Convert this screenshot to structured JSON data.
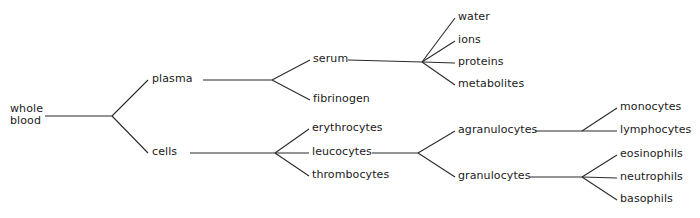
{
  "diagram": {
    "type": "tree-diagram",
    "background_color": "#ffffff",
    "line_color": "#2b2b2b",
    "text_color": "#1a1a1a",
    "nodes": [
      {
        "id": "whole-blood",
        "label": "whole\nblood",
        "x": 10,
        "y": 116,
        "anchor": "left",
        "lines": 2
      },
      {
        "id": "plasma",
        "label": "plasma",
        "x": 152,
        "y": 80,
        "anchor": "left",
        "lines": 1
      },
      {
        "id": "cells",
        "label": "cells",
        "x": 152,
        "y": 153,
        "anchor": "left",
        "lines": 1
      },
      {
        "id": "serum",
        "label": "serum",
        "x": 313,
        "y": 60,
        "anchor": "left",
        "lines": 1
      },
      {
        "id": "fibrinogen",
        "label": "fibrinogen",
        "x": 313,
        "y": 100,
        "anchor": "left",
        "lines": 1
      },
      {
        "id": "water",
        "label": "water",
        "x": 458,
        "y": 18,
        "anchor": "left",
        "lines": 1
      },
      {
        "id": "ions",
        "label": "ions",
        "x": 458,
        "y": 41,
        "anchor": "left",
        "lines": 1
      },
      {
        "id": "proteins",
        "label": "proteins",
        "x": 458,
        "y": 63,
        "anchor": "left",
        "lines": 1
      },
      {
        "id": "metabolites",
        "label": "metabolites",
        "x": 458,
        "y": 85,
        "anchor": "left",
        "lines": 1
      },
      {
        "id": "erythrocytes",
        "label": "erythrocytes",
        "x": 312,
        "y": 129,
        "anchor": "left",
        "lines": 1
      },
      {
        "id": "leucocytes",
        "label": "leucocytes",
        "x": 312,
        "y": 153,
        "anchor": "left",
        "lines": 1
      },
      {
        "id": "thrombocytes",
        "label": "thrombocytes",
        "x": 312,
        "y": 176,
        "anchor": "left",
        "lines": 1
      },
      {
        "id": "agranulocytes",
        "label": "agranulocytes",
        "x": 458,
        "y": 131,
        "anchor": "left",
        "lines": 1
      },
      {
        "id": "granulocytes",
        "label": "granulocytes",
        "x": 458,
        "y": 177,
        "anchor": "left",
        "lines": 1
      },
      {
        "id": "monocytes",
        "label": "monocytes",
        "x": 620,
        "y": 108,
        "anchor": "left",
        "lines": 1
      },
      {
        "id": "lymphocytes",
        "label": "lymphocytes",
        "x": 620,
        "y": 131,
        "anchor": "left",
        "lines": 1
      },
      {
        "id": "eosinophils",
        "label": "eosinophils",
        "x": 620,
        "y": 155,
        "anchor": "left",
        "lines": 1
      },
      {
        "id": "neutrophils",
        "label": "neutrophils",
        "x": 620,
        "y": 178,
        "anchor": "left",
        "lines": 1
      },
      {
        "id": "basophils",
        "label": "basophils",
        "x": 620,
        "y": 200,
        "anchor": "left",
        "lines": 1
      }
    ],
    "edges": [
      {
        "id": "trunk-wholeblood-to-fork1",
        "points": [
          [
            45,
            116
          ],
          [
            112,
            116
          ]
        ]
      },
      {
        "id": "fork1-to-plasma",
        "points": [
          [
            112,
            116
          ],
          [
            148,
            80
          ]
        ]
      },
      {
        "id": "fork1-to-cells",
        "points": [
          [
            112,
            116
          ],
          [
            148,
            153
          ]
        ]
      },
      {
        "id": "plasma-to-fork2",
        "points": [
          [
            203,
            80
          ],
          [
            272,
            80
          ]
        ]
      },
      {
        "id": "fork2-to-serum",
        "points": [
          [
            272,
            80
          ],
          [
            310,
            60
          ]
        ]
      },
      {
        "id": "fork2-to-fibrinogen",
        "points": [
          [
            272,
            80
          ],
          [
            310,
            100
          ]
        ]
      },
      {
        "id": "serum-to-fork3",
        "points": [
          [
            348,
            60
          ],
          [
            422,
            62
          ]
        ]
      },
      {
        "id": "fork3-to-water",
        "points": [
          [
            422,
            62
          ],
          [
            455,
            18
          ]
        ]
      },
      {
        "id": "fork3-to-ions",
        "points": [
          [
            422,
            62
          ],
          [
            455,
            41
          ]
        ]
      },
      {
        "id": "fork3-to-proteins",
        "points": [
          [
            422,
            62
          ],
          [
            455,
            63
          ]
        ]
      },
      {
        "id": "fork3-to-metabolites",
        "points": [
          [
            422,
            62
          ],
          [
            455,
            85
          ]
        ]
      },
      {
        "id": "cells-to-fork4",
        "points": [
          [
            190,
            153
          ],
          [
            275,
            153
          ]
        ]
      },
      {
        "id": "fork4-to-erythrocytes",
        "points": [
          [
            275,
            153
          ],
          [
            309,
            129
          ]
        ]
      },
      {
        "id": "fork4-to-leucocytes",
        "points": [
          [
            275,
            153
          ],
          [
            309,
            153
          ]
        ]
      },
      {
        "id": "fork4-to-thrombocytes",
        "points": [
          [
            275,
            153
          ],
          [
            309,
            176
          ]
        ]
      },
      {
        "id": "leucocytes-to-fork5",
        "points": [
          [
            372,
            153
          ],
          [
            418,
            153
          ]
        ]
      },
      {
        "id": "fork5-to-agranulocytes",
        "points": [
          [
            418,
            153
          ],
          [
            455,
            131
          ]
        ]
      },
      {
        "id": "fork5-to-granulocytes",
        "points": [
          [
            418,
            153
          ],
          [
            455,
            177
          ]
        ]
      },
      {
        "id": "agranulocytes-to-fork6",
        "points": [
          [
            535,
            131
          ],
          [
            582,
            131
          ]
        ]
      },
      {
        "id": "fork6-to-monocytes",
        "points": [
          [
            582,
            131
          ],
          [
            617,
            108
          ]
        ]
      },
      {
        "id": "fork6-to-lymphocytes",
        "points": [
          [
            582,
            131
          ],
          [
            617,
            131
          ]
        ]
      },
      {
        "id": "granulocytes-to-fork7",
        "points": [
          [
            530,
            177
          ],
          [
            582,
            177
          ]
        ]
      },
      {
        "id": "fork7-to-eosinophils",
        "points": [
          [
            582,
            177
          ],
          [
            617,
            155
          ]
        ]
      },
      {
        "id": "fork7-to-neutrophils",
        "points": [
          [
            582,
            177
          ],
          [
            617,
            178
          ]
        ]
      },
      {
        "id": "fork7-to-basophils",
        "points": [
          [
            582,
            177
          ],
          [
            617,
            200
          ]
        ]
      }
    ]
  }
}
